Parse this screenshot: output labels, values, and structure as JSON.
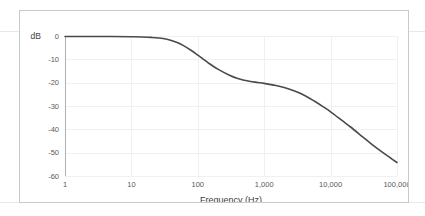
{
  "figure": {
    "border_color": "#c9c9c9",
    "background": "#ffffff"
  },
  "chart_data": {
    "type": "line",
    "title": "",
    "subtitle": "",
    "xlabel": "Frequency (Hz)",
    "ylabel": "dB",
    "y_unit_label": "dB",
    "xscale": "log",
    "xlim": [
      1,
      100000
    ],
    "ylim": [
      -60,
      0
    ],
    "grid": true,
    "legend": null,
    "legend_position": "none",
    "xticks": [
      1,
      10,
      100,
      1000,
      10000,
      100000
    ],
    "xtick_labels": [
      "1",
      "10",
      "100",
      "1,000",
      "10,000",
      "100,000"
    ],
    "yticks": [
      0,
      -10,
      -20,
      -30,
      -40,
      -50,
      -60
    ],
    "ytick_labels": [
      "0",
      "-10",
      "-20",
      "-30",
      "-40",
      "-50",
      "-60"
    ],
    "series": [
      {
        "name": "frequency response",
        "color": "#4a4a4a",
        "x": [
          1,
          2,
          5,
          10,
          15,
          20,
          30,
          40,
          50,
          60,
          80,
          100,
          150,
          200,
          300,
          400,
          600,
          800,
          1000,
          1500,
          2000,
          3000,
          4000,
          6000,
          8000,
          10000,
          15000,
          20000,
          30000,
          40000,
          60000,
          80000,
          100000
        ],
        "y": [
          -0.2,
          -0.2,
          -0.2,
          -0.3,
          -0.4,
          -0.6,
          -1.1,
          -1.9,
          -2.9,
          -4.0,
          -6.2,
          -8.2,
          -11.9,
          -14.2,
          -16.8,
          -18.2,
          -19.4,
          -19.9,
          -20.3,
          -21.2,
          -22.1,
          -23.8,
          -25.4,
          -28.3,
          -30.6,
          -32.5,
          -36.3,
          -39.0,
          -43.1,
          -46.0,
          -49.8,
          -52.3,
          -54.2
        ]
      }
    ]
  }
}
